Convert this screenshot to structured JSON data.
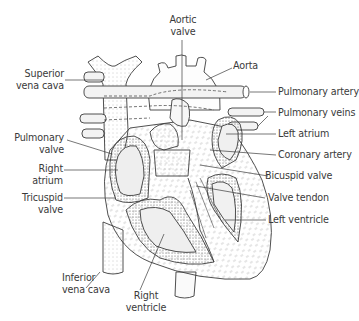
{
  "diagram": {
    "colors": {
      "line": "#3c3c3c",
      "stipple": "#7a7a7a",
      "fill": "#f6f6f6",
      "label": "#3a3a3a"
    },
    "labels": {
      "aortic_valve": [
        "Aortic",
        "valve"
      ],
      "aorta": "Aorta",
      "superior_vena_cava": [
        "Superior",
        "vena cava"
      ],
      "pulmonary_artery": "Pulmonary artery",
      "pulmonary_veins": "Pulmonary veins",
      "left_atrium": "Left atrium",
      "pulmonary_valve": [
        "Pulmonary",
        "valve"
      ],
      "coronary_artery": "Coronary artery",
      "right_atrium": [
        "Right",
        "atrium"
      ],
      "bicuspid_valve": "Bicuspid valve",
      "valve_tendon": "Valve tendon",
      "tricuspid_valve": [
        "Tricuspid",
        "valve"
      ],
      "left_ventricle": "Left ventricle",
      "inferior_vena_cava": [
        "Inferior",
        "vena cava"
      ],
      "right_ventricle": [
        "Right",
        "ventricle"
      ]
    }
  }
}
